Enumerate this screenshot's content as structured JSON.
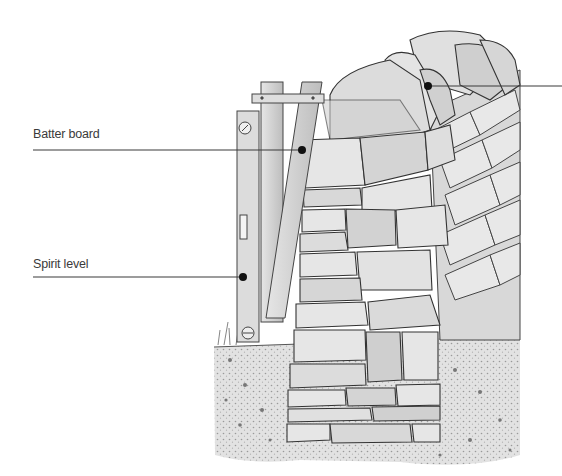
{
  "figure": {
    "labels": [
      {
        "id": "batter-board",
        "text": "Batter board"
      },
      {
        "id": "spirit-level",
        "text": "Spirit level"
      },
      {
        "id": "coping-stones",
        "text": ""
      }
    ],
    "colors": {
      "background": "#ffffff",
      "ink": "#2e2e2e",
      "leader_line": "#3a3a3a",
      "stone_light": "#e4e4e4",
      "stone_mid": "#c9c9c9",
      "stone_dark": "#9a9a9a",
      "wood": "#d2d2d2",
      "ground": "#dcdcdc"
    }
  }
}
